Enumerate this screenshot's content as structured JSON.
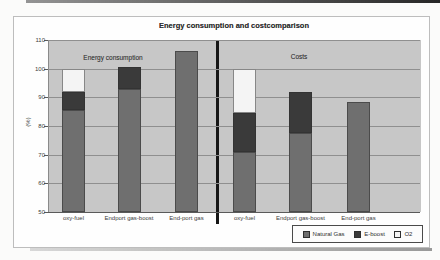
{
  "chart_data": {
    "type": "bar",
    "stacked": true,
    "title": "Energy consumption and costcomparison",
    "ylabel": "(%)",
    "ylim": [
      50,
      110
    ],
    "yticks": [
      110,
      100,
      90,
      80,
      70,
      60,
      50
    ],
    "grid": true,
    "legend_position": "bottom-right",
    "series": [
      {
        "name": "Natural Gas",
        "color": "#6f6f6f"
      },
      {
        "name": "E-boost",
        "color": "#3a3a3a"
      },
      {
        "name": "O2",
        "color": "#f4f4f4"
      }
    ],
    "groups": [
      {
        "label": "Energy consumption",
        "bars": [
          {
            "category": "oxy-fuel",
            "stack_tops": [
              85.5,
              92,
              100
            ]
          },
          {
            "category": "Endport gas-boost",
            "stack_tops": [
              93,
              100.5,
              null
            ]
          },
          {
            "category": "End-port gas",
            "stack_tops": [
              106,
              null,
              null
            ]
          }
        ]
      },
      {
        "label": "Costs",
        "bars": [
          {
            "category": "oxy-fuel",
            "stack_tops": [
              71,
              84.5,
              100
            ]
          },
          {
            "category": "Endport gas-boost",
            "stack_tops": [
              77.5,
              92,
              null
            ]
          },
          {
            "category": "End-port gas",
            "stack_tops": [
              88.5,
              null,
              null
            ]
          }
        ]
      }
    ]
  }
}
